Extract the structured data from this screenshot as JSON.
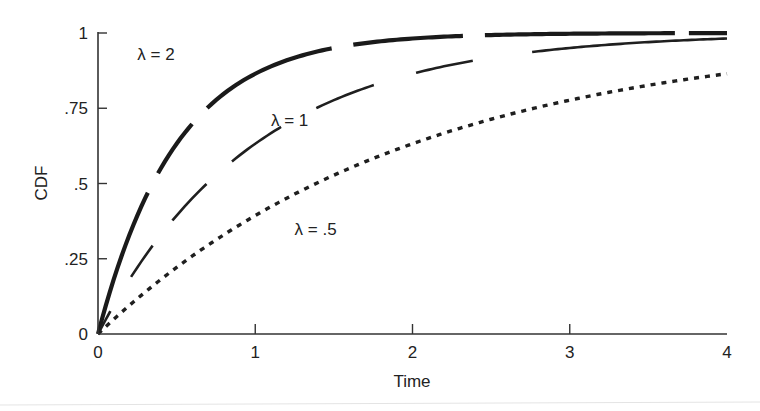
{
  "chart_data": {
    "type": "line",
    "title": "",
    "xlabel": "Time",
    "ylabel": "CDF",
    "xlim": [
      0,
      4
    ],
    "ylim": [
      0,
      1
    ],
    "grid": false,
    "legend": "inline labels",
    "x_ticks": [
      {
        "value": 0,
        "label": "0"
      },
      {
        "value": 1,
        "label": "1"
      },
      {
        "value": 2,
        "label": "2"
      },
      {
        "value": 3,
        "label": "3"
      },
      {
        "value": 4,
        "label": "4"
      }
    ],
    "y_ticks": [
      {
        "value": 0,
        "label": "0"
      },
      {
        "value": 0.25,
        "label": ".25"
      },
      {
        "value": 0.5,
        "label": ".5"
      },
      {
        "value": 0.75,
        "label": ".75"
      },
      {
        "value": 1,
        "label": "1"
      }
    ],
    "function": "1 - exp(-lambda * t)",
    "x": [
      0,
      0.25,
      0.5,
      0.75,
      1,
      1.25,
      1.5,
      1.75,
      2,
      2.25,
      2.5,
      2.75,
      3,
      3.25,
      3.5,
      3.75,
      4
    ],
    "series": [
      {
        "name": "λ = 2",
        "lambda": 2,
        "style": "thick-long-dash",
        "values": [
          0,
          0.393,
          0.632,
          0.777,
          0.865,
          0.918,
          0.95,
          0.97,
          0.982,
          0.989,
          0.993,
          0.996,
          0.998,
          0.998,
          0.999,
          0.999,
          1.0
        ]
      },
      {
        "name": "λ = 1",
        "lambda": 1,
        "style": "medium-dash",
        "values": [
          0,
          0.221,
          0.393,
          0.528,
          0.632,
          0.713,
          0.777,
          0.826,
          0.865,
          0.895,
          0.918,
          0.936,
          0.95,
          0.961,
          0.97,
          0.976,
          0.982
        ]
      },
      {
        "name": "λ = .5",
        "lambda": 0.5,
        "style": "dotted",
        "values": [
          0,
          0.118,
          0.221,
          0.313,
          0.393,
          0.465,
          0.528,
          0.583,
          0.632,
          0.675,
          0.713,
          0.747,
          0.777,
          0.803,
          0.826,
          0.847,
          0.865
        ]
      }
    ],
    "annotations": [
      {
        "text": "λ = 2",
        "series": "λ = 2",
        "x": 0.25,
        "y": 0.91
      },
      {
        "text": "λ = 1",
        "series": "λ = 1",
        "x": 1.1,
        "y": 0.69
      },
      {
        "text": "λ = .5",
        "series": "λ = .5",
        "x": 1.25,
        "y": 0.33
      }
    ]
  }
}
